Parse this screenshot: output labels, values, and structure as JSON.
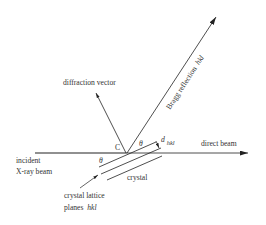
{
  "diagram": {
    "labels": {
      "diffraction_vector": "diffraction vector",
      "bragg_reflection": "Bragg reflection",
      "bragg_hkl": "hkl",
      "direct_beam": "direct beam",
      "incident_line1": "incident",
      "incident_line2": "X-ray beam",
      "crystal": "crystal",
      "lattice_line1": "crystal lattice",
      "lattice_line2_prefix": "planes",
      "lattice_line2_hkl": "hkl",
      "point_c": "C",
      "theta_upper": "θ",
      "theta_lower": "θ",
      "d_symbol": "d",
      "d_subscript": "hkl"
    },
    "colors": {
      "line": "#222222",
      "text": "#333333",
      "background": "#ffffff"
    }
  }
}
